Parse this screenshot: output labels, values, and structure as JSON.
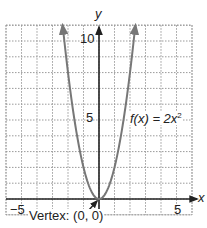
{
  "chart_data": {
    "type": "line",
    "title": "",
    "xlabel": "x",
    "ylabel": "y",
    "xlim": [
      -6,
      6
    ],
    "ylim": [
      -1,
      11
    ],
    "grid": true,
    "grid_style": "dotted",
    "x_tick_labels": [
      {
        "value": -5,
        "label": "−5"
      },
      {
        "value": 5,
        "label": "5"
      }
    ],
    "y_tick_labels": [
      {
        "value": 5,
        "label": "5"
      },
      {
        "value": 10,
        "label": "10"
      }
    ],
    "series": [
      {
        "name": "f(x) = 2x²",
        "function": "2*x^2",
        "x": [
          -2.35,
          -2,
          -1.5,
          -1,
          -0.5,
          0,
          0.5,
          1,
          1.5,
          2,
          2.35
        ],
        "y": [
          11.0,
          8,
          4.5,
          2,
          0.5,
          0,
          0.5,
          2,
          4.5,
          8,
          11.0
        ],
        "color": "#777777",
        "arrows_at_ends": true
      }
    ],
    "annotations": [
      {
        "text": "f(x) = 2x²",
        "position": "right of curve near y=5"
      },
      {
        "text": "Vertex: (0, 0)",
        "points_to": [
          0,
          0
        ]
      }
    ],
    "legend": null
  },
  "labels": {
    "x_axis": "x",
    "y_axis": "y",
    "y_tick_10": "10",
    "y_tick_5": "5",
    "x_tick_neg5": "−5",
    "x_tick_5": "5",
    "function_name": "f(x) = 2x",
    "function_exponent": "2",
    "vertex": "Vertex: (0, 0)"
  },
  "colors": {
    "axis": "#222222",
    "grid": "#9a9a9a",
    "curve": "#777777",
    "background": "#ffffff"
  }
}
